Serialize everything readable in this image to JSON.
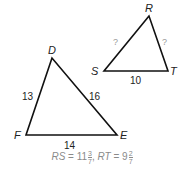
{
  "triangle_def": {
    "vertices": {
      "D": "D",
      "E": "E",
      "F": "F"
    },
    "sides": {
      "DF": "13",
      "DE": "16",
      "FE": "14"
    }
  },
  "triangle_rst": {
    "vertices": {
      "R": "R",
      "S": "S",
      "T": "T"
    },
    "sides": {
      "RS": "?",
      "RT": "?",
      "ST": "10"
    }
  },
  "caption": {
    "rs_label": "RS",
    "eq1": " = 11",
    "rs_num": "3",
    "rs_den": "7",
    "sep": ", ",
    "rt_label": "RT",
    "eq2": " = 9",
    "rt_num": "2",
    "rt_den": "7"
  }
}
